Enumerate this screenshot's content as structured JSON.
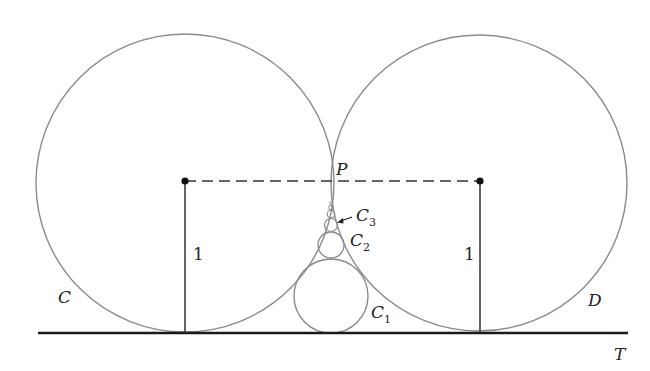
{
  "diagram": {
    "labels": {
      "C": "C",
      "D": "D",
      "T": "T",
      "P": "P",
      "C1": "C",
      "C1_sub": "1",
      "C2": "C",
      "C2_sub": "2",
      "C3": "C",
      "C3_sub": "3",
      "radius_left": "1",
      "radius_right": "1"
    },
    "colors": {
      "circle_stroke": "#8a8a8a",
      "line_stroke": "#1a1a1a",
      "text": "#222222"
    }
  }
}
